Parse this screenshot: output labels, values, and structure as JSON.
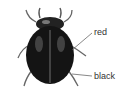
{
  "figure": {
    "labels": [
      {
        "text": "red",
        "target": "shell-edge"
      },
      {
        "text": "black",
        "target": "body-underside"
      }
    ]
  },
  "colors": {
    "shell": "#1a1a1a",
    "leg": "#555555",
    "leader_line": "#555555",
    "label_text": "#333333",
    "background": "#ffffff"
  }
}
